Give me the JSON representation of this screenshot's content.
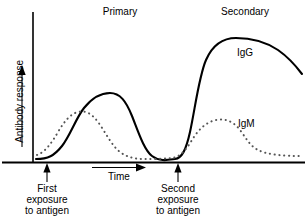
{
  "figure": {
    "title_phases": {
      "primary": "Primary",
      "secondary": "Secondary"
    },
    "axes": {
      "y_title": "Antibody response",
      "x_title": "Time"
    },
    "annotations": {
      "first_exposure": "First exposure to antigen",
      "first_exposure_lines": "First\nexposure\nto antigen",
      "second_exposure": "Second exposure to antigen",
      "second_exposure_lines": "Second\nexposure\nto antigen"
    },
    "series_labels": {
      "igg": "IgG",
      "igm": "IgM"
    },
    "colors": {
      "axis": "#000000",
      "igg_curve": "#000000",
      "igm_curve": "#555555",
      "background": "#ffffff"
    }
  },
  "chart_data": {
    "type": "line",
    "xlabel": "Time",
    "ylabel": "Antibody response",
    "grid": false,
    "legend_position": "inline-curve-labels",
    "axis_ranges": {
      "x": [
        0,
        100
      ],
      "y": [
        0,
        100
      ]
    },
    "annotations": [
      {
        "name": "Primary",
        "type": "phase-label",
        "x": 25
      },
      {
        "name": "Secondary",
        "type": "phase-label",
        "x": 76
      },
      {
        "name": "First exposure to antigen",
        "type": "event-arrow",
        "x": 4
      },
      {
        "name": "Second exposure to antigen",
        "type": "event-arrow",
        "x": 55
      },
      {
        "name": "Time",
        "type": "direction-arrow",
        "x_from": 23,
        "x_to": 43
      }
    ],
    "series": [
      {
        "name": "IgG",
        "style": "solid",
        "x": [
          2,
          6,
          12,
          18,
          24,
          30,
          33,
          38,
          44,
          50,
          54,
          56,
          60,
          63,
          66,
          70,
          75,
          80,
          86,
          92,
          98
        ],
        "values": [
          2,
          3,
          8,
          22,
          42,
          54,
          55,
          48,
          30,
          12,
          4,
          3,
          10,
          40,
          70,
          84,
          88,
          89,
          86,
          80,
          72
        ]
      },
      {
        "name": "IgM",
        "style": "dotted",
        "x": [
          2,
          6,
          10,
          15,
          20,
          24,
          28,
          33,
          38,
          44,
          50,
          55,
          58,
          62,
          66,
          70,
          75,
          80,
          86,
          92,
          98
        ],
        "values": [
          4,
          9,
          18,
          30,
          38,
          40,
          38,
          31,
          22,
          13,
          6,
          4,
          9,
          20,
          30,
          33,
          32,
          26,
          18,
          13,
          11
        ]
      }
    ]
  }
}
